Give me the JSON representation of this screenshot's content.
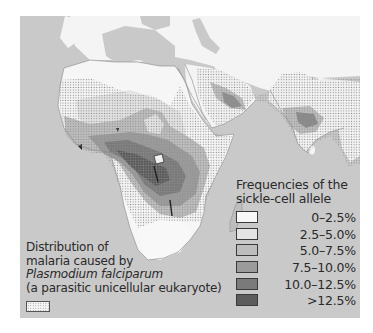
{
  "map": {
    "type": "choropleth",
    "region": "Africa, Middle East and South Asia",
    "ocean_color": "#c9c9c9",
    "land_color": "#f7f7f7"
  },
  "legend": {
    "title_line1": "Frequencies of the",
    "title_line2": "sickle-cell allele",
    "items": [
      {
        "label": "0–2.5%",
        "color": "#f8f8f8"
      },
      {
        "label": "2.5–5.0%",
        "color": "#e4e4e4"
      },
      {
        "label": "5.0–7.5%",
        "color": "#bdbdbd"
      },
      {
        "label": "7.5–10.0%",
        "color": "#9b9b9b"
      },
      {
        "label": "10.0–12.5%",
        "color": "#7a7a7a"
      },
      {
        "label": ">12.5%",
        "color": "#5c5c5c"
      }
    ]
  },
  "malaria": {
    "line1": "Distribution of",
    "line2": "malaria caused by",
    "line3": "Plasmodium falciparum",
    "line4": "(a parasitic unicellular eukaryote)",
    "pattern": "stippled dots"
  }
}
